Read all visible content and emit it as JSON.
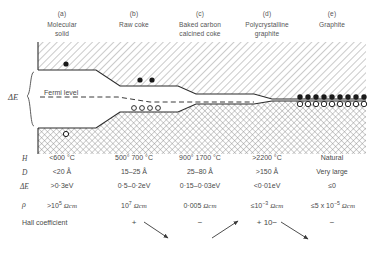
{
  "figure": {
    "columns": [
      {
        "tag": "(a)",
        "name": "Molecular\nsolid",
        "name_line1": "Molecular",
        "name_line2": "solid",
        "center_x": 62
      },
      {
        "tag": "(b)",
        "name": "Raw coke",
        "name_line1": "Raw coke",
        "name_line2": "",
        "center_x": 134
      },
      {
        "tag": "(c)",
        "name": "Baked carbon\ncalcined coke",
        "name_line1": "Baked carbon",
        "name_line2": "calcined coke",
        "center_x": 200
      },
      {
        "tag": "(d)",
        "name": "Polycrystalline\ngraphite",
        "name_line1": "Polycrystalline",
        "name_line2": "graphite",
        "center_x": 267
      },
      {
        "tag": "(e)",
        "name": "Graphite",
        "name_line1": "Graphite",
        "name_line2": "",
        "center_x": 332
      }
    ],
    "diagram": {
      "gap_label": "ΔE",
      "fermi_label": "Fermi level",
      "conduction_band_name": "conduction-band",
      "valence_band_name": "valence-band",
      "electron_symbol": "filled-circle",
      "hole_symbol": "open-circle"
    },
    "rows": [
      {
        "symbol": "H",
        "name": "heat-treatment-temperature",
        "values": [
          "<600 °C",
          "500° 700 °C",
          "900° 1700 °C",
          ">2200 °C",
          "Natural"
        ]
      },
      {
        "symbol": "D",
        "name": "crystallite-size",
        "values": [
          "<20 Å",
          "15–25 Å",
          "25–80 Å",
          ">150 Å",
          "Very large"
        ]
      },
      {
        "symbol": "ΔE",
        "name": "energy-gap",
        "values": [
          ">0·3eV",
          "0·5–0·2eV",
          "0·15–0·03eV",
          "<0·01eV",
          "≤0"
        ]
      }
    ],
    "resistivity_row": {
      "symbol": "ρ",
      "name": "resistivity",
      "values": [
        {
          "mantissa": ">10",
          "exponent": "5",
          "unit": "Ωcm"
        },
        {
          "mantissa": "10",
          "exponent": "7",
          "unit": "Ωcm"
        },
        {
          "mantissa": "0·005",
          "exponent": "",
          "unit": "Ωcm"
        },
        {
          "mantissa": "≤10",
          "exponent": "−3",
          "unit": "Ωcm"
        },
        {
          "mantissa": "≤5 x 10",
          "exponent": "−5",
          "unit": "Ωcm"
        }
      ]
    },
    "hall_row": {
      "label": "Hall coefficient",
      "name": "hall-coefficient",
      "signs": [
        "+",
        "−",
        "+ 10−",
        "−"
      ],
      "sign_x": [
        134,
        200,
        267,
        332
      ]
    }
  }
}
